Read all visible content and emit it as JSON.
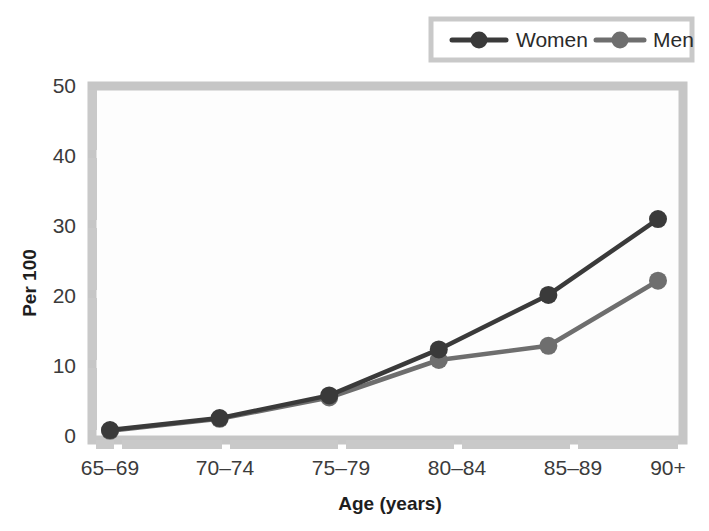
{
  "chart_data": {
    "type": "line",
    "title": "",
    "xlabel": "Age (years)",
    "ylabel": "Per 100",
    "categories": [
      "65–69",
      "70–74",
      "75–79",
      "80–84",
      "85–89",
      "90+"
    ],
    "ylim": [
      0,
      50
    ],
    "yticks": [
      0,
      10,
      20,
      30,
      40,
      50
    ],
    "ytick_labels": [
      "0",
      "10",
      "20",
      "30",
      "40",
      "50"
    ],
    "grid": false,
    "legend_position": "top-right",
    "series": [
      {
        "name": "Women",
        "color": "#3a3a3a",
        "marker": "circle",
        "values": [
          1.4,
          3.1,
          6.3,
          12.8,
          20.5,
          31.2
        ]
      },
      {
        "name": "Men",
        "color": "#6e6e6e",
        "marker": "circle",
        "values": [
          1.3,
          3.0,
          6.0,
          11.3,
          13.3,
          22.5
        ]
      }
    ]
  },
  "legend": {
    "items": [
      {
        "label": "Women",
        "color": "#3a3a3a"
      },
      {
        "label": "Men",
        "color": "#6e6e6e"
      }
    ]
  },
  "axes": {
    "x_title": "Age (years)",
    "y_title": "Per 100"
  },
  "colors": {
    "women": "#3a3a3a",
    "men": "#6e6e6e",
    "frame": "#c6c6c6",
    "axis_band": "#c9c9c9",
    "plot_background": "#fdfdfd"
  }
}
